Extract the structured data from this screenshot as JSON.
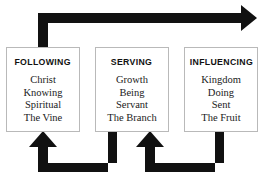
{
  "diagram": {
    "background_color": "#ffffff",
    "arrow_color": "#111111",
    "box_border_color": "#b9b9b9",
    "boxes": [
      {
        "id": "following",
        "title": "FOLLOWING",
        "items": [
          "Christ",
          "Knowing",
          "Spiritual",
          "The Vine"
        ]
      },
      {
        "id": "serving",
        "title": "SERVING",
        "items": [
          "Growth",
          "Being",
          "Servant",
          "The Branch"
        ]
      },
      {
        "id": "influencing",
        "title": "INFLUENCING",
        "items": [
          "Kingdom",
          "Doing",
          "Sent",
          "The Fruit"
        ]
      }
    ],
    "arrows": [
      {
        "id": "top-arrow",
        "from": "following",
        "to": "influencing-right",
        "direction": "up-then-right"
      },
      {
        "id": "bottom-left-arrow",
        "from": "serving",
        "to": "following",
        "direction": "down-then-left-then-up"
      },
      {
        "id": "bottom-right-arrow",
        "from": "influencing",
        "to": "serving",
        "direction": "down-then-left-then-up"
      }
    ]
  }
}
